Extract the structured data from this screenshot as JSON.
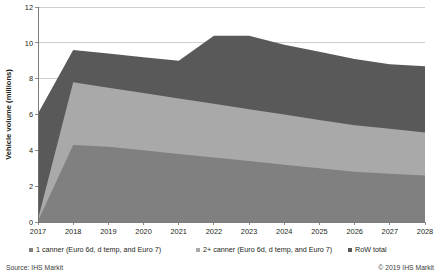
{
  "chart_data": {
    "type": "area",
    "stacked": true,
    "title": "",
    "subtitle": "",
    "xlabel": "",
    "ylabel": "Vehicle volume (millions)",
    "categories": [
      "2017",
      "2018",
      "2019",
      "2020",
      "2021",
      "2022",
      "2023",
      "2024",
      "2025",
      "2026",
      "2027",
      "2028"
    ],
    "x": [
      2017,
      2018,
      2019,
      2020,
      2021,
      2022,
      2023,
      2024,
      2025,
      2026,
      2027,
      2028
    ],
    "xlim": [
      2017,
      2028
    ],
    "ylim": [
      0,
      12
    ],
    "yticks": [
      0,
      2,
      4,
      6,
      8,
      10,
      12
    ],
    "ytick_labels": [
      "0",
      "2",
      "4",
      "6",
      "8",
      "10",
      "12"
    ],
    "grid": "horizontal",
    "legend_position": "bottom",
    "series": [
      {
        "name": "1 canner (Euro 6d, d temp, and Euro 7)",
        "color": "#808080",
        "values": [
          0.05,
          4.3,
          4.2,
          4.0,
          3.8,
          3.6,
          3.4,
          3.2,
          3.0,
          2.8,
          2.7,
          2.6
        ]
      },
      {
        "name": "2+ canner (Euro 6d, d temp, and Euro 7)",
        "color": "#a9a9a9",
        "values": [
          0.1,
          3.5,
          3.3,
          3.2,
          3.1,
          3.0,
          2.9,
          2.8,
          2.7,
          2.6,
          2.5,
          2.4
        ]
      },
      {
        "name": "RoW total",
        "color": "#595959",
        "values": [
          5.9,
          1.8,
          1.9,
          2.0,
          2.1,
          3.8,
          4.1,
          3.9,
          3.8,
          3.7,
          3.6,
          3.7
        ]
      }
    ],
    "totals": [
      6.05,
      9.6,
      9.4,
      9.2,
      9.0,
      10.4,
      10.4,
      9.9,
      9.5,
      9.1,
      8.8,
      8.7
    ]
  },
  "legend": {
    "items": [
      {
        "label": "1 canner (Euro 6d, d temp, and Euro 7)",
        "color": "#808080",
        "marker": "square-marker-icon"
      },
      {
        "label": "2+ canner (Euro 6d, d temp, and Euro 7)",
        "color": "#a9a9a9",
        "marker": "square-marker-icon"
      },
      {
        "label": "RoW total",
        "color": "#595959",
        "marker": "square-marker-icon"
      }
    ]
  },
  "footer": {
    "source": "Source: IHS Markit",
    "copyright": "© 2019 IHS Markit"
  }
}
